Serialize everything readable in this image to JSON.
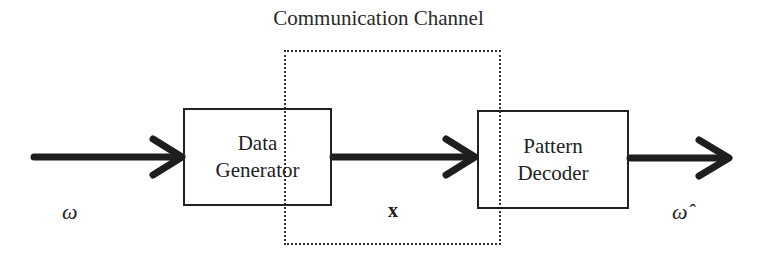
{
  "diagram": {
    "title": "Communication Channel",
    "nodes": [
      {
        "id": "data_generator",
        "label_line1": "Data",
        "label_line2": "Generator"
      },
      {
        "id": "pattern_decoder",
        "label_line1": "Pattern",
        "label_line2": "Decoder"
      }
    ],
    "group": {
      "id": "communication_channel",
      "label": "Communication Channel",
      "style": "dotted"
    },
    "edges": [
      {
        "from": "input",
        "to": "data_generator",
        "label": "ω"
      },
      {
        "from": "data_generator",
        "to": "pattern_decoder",
        "label": "x"
      },
      {
        "from": "pattern_decoder",
        "to": "output",
        "label": "ω̂"
      }
    ],
    "labels": {
      "input_symbol": "ω",
      "signal_symbol": "x",
      "output_symbol": "ω̂"
    }
  }
}
